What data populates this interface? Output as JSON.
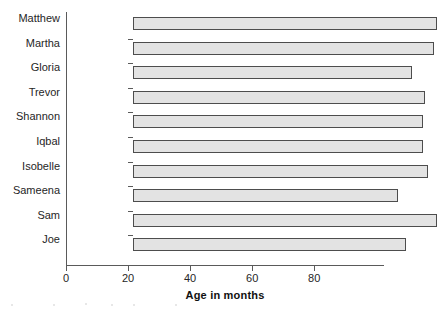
{
  "chart_data": {
    "type": "bar",
    "orientation": "horizontal",
    "title": "",
    "xlabel": "Age in months",
    "ylabel": "",
    "categories": [
      "Matthew",
      "Martha",
      "Gloria",
      "Trevor",
      "Shannon",
      "Iqbal",
      "Isobelle",
      "Sameena",
      "Sam",
      "Joe"
    ],
    "values": [
      98,
      97,
      90,
      94,
      93.5,
      93.5,
      95,
      85.5,
      98,
      88
    ],
    "xlim": [
      0,
      102.5
    ],
    "xticks": [
      0,
      20,
      40,
      60,
      80
    ],
    "xtick_labels": [
      "0",
      "20",
      "40",
      "60",
      "80"
    ],
    "grid": false,
    "legend": false,
    "bar_fill_color": "#e3e3e3",
    "bar_border_color": "#4d4d4d",
    "axis_color": "#5a5a5a"
  }
}
